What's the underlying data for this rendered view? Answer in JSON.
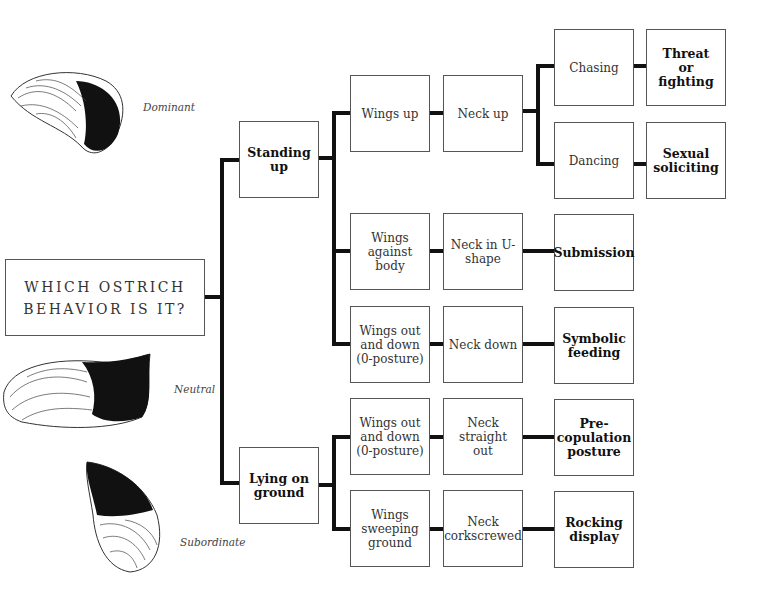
{
  "title": "WHICH OSTRICH\nBEHAVIOR IS IT?",
  "feather_labels": {
    "dominant": "Dominant",
    "neutral": "Neutral",
    "subordinate": "Subordinate"
  },
  "level1": {
    "standing": "Standing up",
    "lying": "Lying on\nground"
  },
  "wings": {
    "up": "Wings up",
    "against_body": "Wings\nagainst body",
    "out_down_1": "Wings out\nand down\n(0-posture)",
    "out_down_2": "Wings out\nand down\n(0-posture)",
    "sweeping": "Wings\nsweeping\nground"
  },
  "neck": {
    "up": "Neck up",
    "u_shape": "Neck in U-\nshape",
    "down": "Neck down",
    "straight": "Neck straight\nout",
    "corkscrewed": "Neck\ncorkscrewed"
  },
  "actions": {
    "chasing": "Chasing",
    "dancing": "Dancing"
  },
  "outcomes": {
    "threat": "Threat\nor\nfighting",
    "sexual": "Sexual\nsoliciting",
    "submission": "Submission",
    "symbolic": "Symbolic\nfeeding",
    "precopulation": "Pre-\ncopulation\nposture",
    "rocking": "Rocking\ndisplay"
  }
}
